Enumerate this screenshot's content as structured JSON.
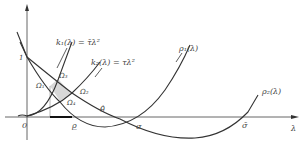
{
  "diagram": {
    "axes": {
      "x_label": "λ",
      "origin_label": "0",
      "y_tick_label": "1"
    },
    "curves": {
      "k1_label": "k₁(λ) = τ̄λ²",
      "k2_label": "k₂(λ) = τλ²",
      "rho1_label": "ρ₁(λ)",
      "rho2_label": "ρ₂(λ)"
    },
    "regions": {
      "omega1": "Ω₁",
      "omega2": "Ω₂",
      "omega3": "Ω₃",
      "omega4": "Ω₄"
    },
    "points": {
      "rho_under": "ρ̲",
      "theta_hat": "θ̂",
      "sigma": "σ",
      "sigma_bar": "σ̄"
    },
    "colors": {
      "line": "#333333",
      "shade": "#d8d8d8",
      "background": "#ffffff"
    }
  }
}
